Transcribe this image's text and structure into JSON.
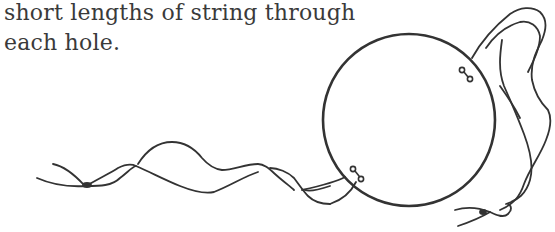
{
  "instruction_text": {
    "line1": "short lengths of string through",
    "line2": "each hole."
  },
  "illustration": {
    "subject": "circle-with-strings",
    "stroke_color": "#333333",
    "circle": {
      "cx": 409,
      "cy": 120,
      "r": 86
    },
    "holes": [
      {
        "name": "upper-right-hole-pair",
        "x": 465,
        "y": 72
      },
      {
        "name": "lower-left-hole-pair",
        "x": 357,
        "y": 173
      }
    ]
  }
}
